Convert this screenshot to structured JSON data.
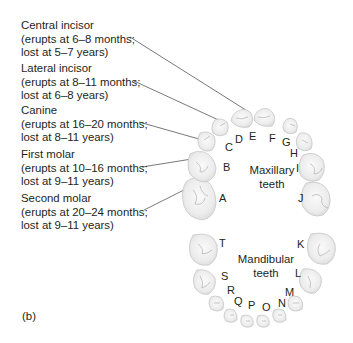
{
  "figure": {
    "panel_label": "(b)",
    "callouts": [
      {
        "name": "Central incisor",
        "erupts": "(erupts at 6–8 months;",
        "lost": "lost at 5–7 years)"
      },
      {
        "name": "Lateral incisor",
        "erupts": "(erupts at 8–11 months;",
        "lost": "lost at 6–8 years)"
      },
      {
        "name": "Canine",
        "erupts": "(erupts at 16–20 months;",
        "lost": "lost at 8–11 years)"
      },
      {
        "name": "First molar",
        "erupts": "(erupts at 10–16 months;",
        "lost": "lost at 9–11 years)"
      },
      {
        "name": "Second molar",
        "erupts": "(erupts at 20–24 months;",
        "lost": "lost at 9–11 years)"
      }
    ],
    "maxillary": {
      "title_line1": "Maxillary",
      "title_line2": "teeth",
      "letters": [
        "A",
        "B",
        "C",
        "D",
        "E",
        "F",
        "G",
        "H",
        "I",
        "J"
      ]
    },
    "mandibular": {
      "title_line1": "Mandibular",
      "title_line2": "teeth",
      "letters": [
        "K",
        "L",
        "M",
        "N",
        "O",
        "P",
        "Q",
        "R",
        "S",
        "T"
      ]
    },
    "colors": {
      "text": "#231f20",
      "leader_line": "#555555",
      "tooth_fill": "#f2f2f2",
      "tooth_stroke": "#c8c8c8",
      "tooth_detail": "#b0b0b0"
    }
  }
}
